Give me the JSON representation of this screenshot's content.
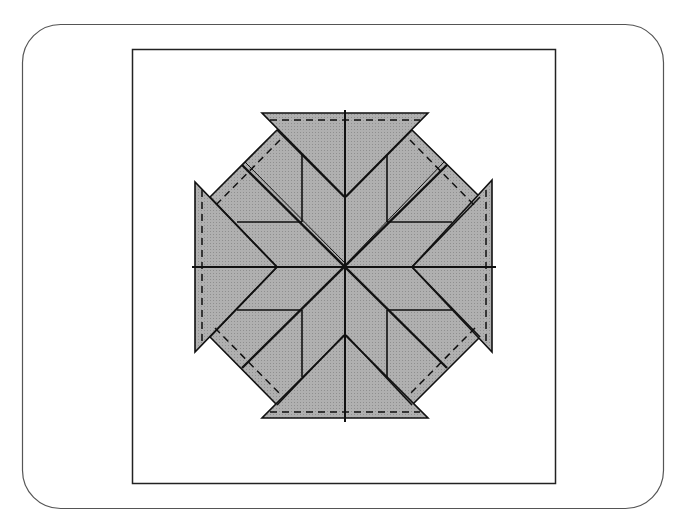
{
  "figure": {
    "title": "",
    "colors": {
      "background": "#ffffff",
      "frame_stroke": "#555555",
      "inner_frame_stroke": "#222222",
      "shape_fill": "#a9a9a9",
      "line_stroke": "#111111",
      "seam_dash": "#111111"
    },
    "outer_frame": {
      "x": 22,
      "y": 24,
      "width": 641,
      "height": 484,
      "radius": 38
    },
    "inner_frame": {
      "x": 132,
      "y": 49,
      "width": 423,
      "height": 434
    },
    "center": {
      "x": 344,
      "y": 266
    }
  }
}
